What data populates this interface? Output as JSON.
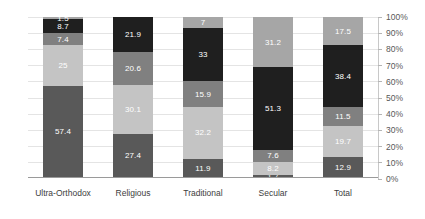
{
  "chart_data": {
    "type": "bar",
    "subtype": "stacked-percent",
    "title": "",
    "xlabel": "",
    "ylabel": "",
    "ylim": [
      0,
      100
    ],
    "grid": true,
    "legend": "none",
    "y_axis_position": "right",
    "categories": [
      "Ultra-Orthodox",
      "Religious",
      "Traditional",
      "Secular",
      "Total"
    ],
    "ytick_labels": [
      "0%",
      "10%",
      "20%",
      "30%",
      "40%",
      "50%",
      "60%",
      "70%",
      "80%",
      "90%",
      "100%"
    ],
    "ytick_values": [
      0,
      10,
      20,
      30,
      40,
      50,
      60,
      70,
      80,
      90,
      100
    ],
    "series": [
      {
        "name": "series-1",
        "color": "#595959",
        "label_color": "light",
        "values": [
          57.4,
          27.4,
          11.9,
          1.7,
          12.9
        ],
        "labels": [
          "57.4",
          "27.4",
          "11.9",
          "1.7",
          "12.9"
        ]
      },
      {
        "name": "series-2",
        "color": "#c4c4c4",
        "label_color": "light",
        "values": [
          25,
          30.1,
          32.2,
          8.2,
          19.7
        ],
        "labels": [
          "25",
          "30.1",
          "32.2",
          "8.2",
          "19.7"
        ]
      },
      {
        "name": "series-3",
        "color": "#808080",
        "label_color": "light",
        "values": [
          7.4,
          20.6,
          15.9,
          7.6,
          11.5
        ],
        "labels": [
          "7.4",
          "20.6",
          "15.9",
          "7.6",
          "11.5"
        ]
      },
      {
        "name": "series-4",
        "color": "#1f1f1f",
        "label_color": "light",
        "values": [
          8.7,
          21.9,
          33,
          51.3,
          38.4
        ],
        "labels": [
          "8.7",
          "21.9",
          "33",
          "51.3",
          "38.4"
        ]
      },
      {
        "name": "series-5",
        "color": "#a6a6a6",
        "label_color": "light",
        "values": [
          1.5,
          0,
          7,
          31.2,
          17.5
        ],
        "labels": [
          "1.5",
          "",
          "7",
          "31.2",
          "17.5"
        ]
      }
    ]
  }
}
